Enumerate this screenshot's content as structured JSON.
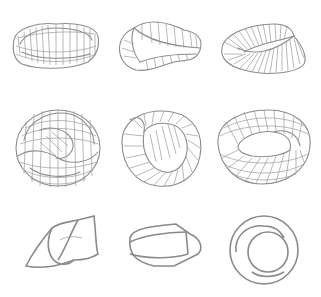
{
  "figure": {
    "stroke_color": "#8c8c8c",
    "background": "#ffffff",
    "rows": [
      {
        "items": [
          {
            "id": "r1c1",
            "shape": "mobius-strip-grid"
          },
          {
            "id": "r1c2",
            "shape": "twisted-band-ruled"
          },
          {
            "id": "r1c3",
            "shape": "mobius-strip-ruled-dense"
          }
        ]
      },
      {
        "items": [
          {
            "id": "r2c1",
            "shape": "knotted-torus-grid"
          },
          {
            "id": "r2c2",
            "shape": "twisted-torus-ruled"
          },
          {
            "id": "r2c3",
            "shape": "twisted-torus-grid"
          }
        ]
      },
      {
        "items": [
          {
            "id": "r3c1",
            "shape": "folded-band-outline"
          },
          {
            "id": "r3c2",
            "shape": "prism-band-outline"
          },
          {
            "id": "r3c3",
            "shape": "double-ring-outline"
          }
        ]
      }
    ]
  }
}
